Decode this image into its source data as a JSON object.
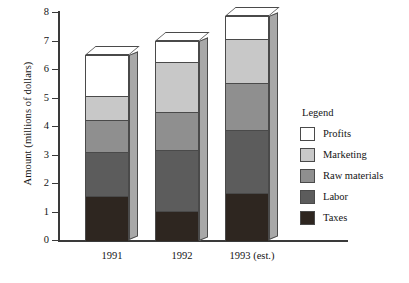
{
  "chart_data": {
    "type": "bar",
    "stacked": true,
    "title": "",
    "xlabel": "",
    "ylabel": "Amount (millions of dollars)",
    "categories": [
      "1991",
      "1992",
      "1993 (est.)"
    ],
    "ylim": [
      0,
      8
    ],
    "ytick_labels": [
      "0",
      "1",
      "2",
      "3",
      "4",
      "5",
      "6",
      "7",
      "8"
    ],
    "ytick_values": [
      0,
      1,
      2,
      3,
      4,
      5,
      6,
      7,
      8
    ],
    "grid": false,
    "legend_position": "right",
    "legend_title": "Legend",
    "series": [
      {
        "name": "Taxes",
        "color": "#2e2620",
        "values": [
          1.55,
          1.0,
          1.65
        ]
      },
      {
        "name": "Labor",
        "color": "#5c5c5c",
        "values": [
          1.55,
          2.15,
          2.2
        ]
      },
      {
        "name": "Raw materials",
        "color": "#8f8f8f",
        "values": [
          1.1,
          1.35,
          1.65
        ]
      },
      {
        "name": "Marketing",
        "color": "#c8c8c8",
        "values": [
          0.85,
          1.75,
          1.55
        ]
      },
      {
        "name": "Profits",
        "color": "#ffffff",
        "values": [
          1.45,
          0.75,
          0.8
        ]
      }
    ],
    "totals": [
      6.5,
      7.0,
      7.85
    ],
    "cumulative_tops": [
      [
        1.55,
        3.1,
        4.2,
        5.05,
        6.5
      ],
      [
        1.0,
        3.15,
        4.5,
        6.25,
        7.0
      ],
      [
        1.65,
        3.85,
        5.5,
        7.05,
        7.85
      ]
    ]
  },
  "legend": {
    "title": "Legend",
    "items": [
      {
        "label": "Profits",
        "color": "#ffffff"
      },
      {
        "label": "Marketing",
        "color": "#c8c8c8"
      },
      {
        "label": "Raw materials",
        "color": "#8f8f8f"
      },
      {
        "label": "Labor",
        "color": "#5c5c5c"
      },
      {
        "label": "Taxes",
        "color": "#2e2620"
      }
    ]
  }
}
